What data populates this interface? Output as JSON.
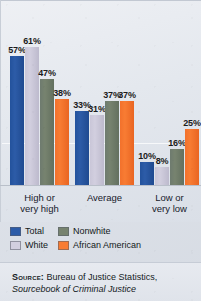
{
  "chart_data": {
    "type": "bar",
    "title": "",
    "subtitle": "",
    "xlabel": "",
    "ylabel": "",
    "ylim": [
      0,
      70
    ],
    "grid": true,
    "legend_position": "bottom-left",
    "categories": [
      "High or very high",
      "Average",
      "Low or very low"
    ],
    "category_lines": [
      [
        "High or",
        "very high"
      ],
      [
        "Average",
        ""
      ],
      [
        "Low or",
        "very low"
      ]
    ],
    "series": [
      {
        "name": "Total",
        "color": "#2d5ca8",
        "values": [
          57,
          33,
          10
        ],
        "labels": [
          "57%",
          "33%",
          "10%"
        ]
      },
      {
        "name": "White",
        "color": "#d2cfdf",
        "values": [
          61,
          31,
          8
        ],
        "labels": [
          "61%",
          "31%",
          "8%"
        ]
      },
      {
        "name": "Nonwhite",
        "color": "#77836f",
        "values": [
          47,
          37,
          16
        ],
        "labels": [
          "47%",
          "37%",
          "16%"
        ]
      },
      {
        "name": "African American",
        "color": "#f87c33",
        "values": [
          38,
          37,
          25
        ],
        "labels": [
          "38%",
          "37%",
          "25%"
        ]
      }
    ],
    "value_suffix": "%"
  },
  "legend": {
    "entries": [
      {
        "label": "Total",
        "color": "#2d5ca8"
      },
      {
        "label": "White",
        "color": "#d2cfdf"
      },
      {
        "label": "Nonwhite",
        "color": "#77836f"
      },
      {
        "label": "African American",
        "color": "#f87c33"
      }
    ]
  },
  "source": {
    "kicker": "Source:",
    "line1": " Bureau of Justice Statistics,",
    "line2": "Sourcebook of Criminal Justice"
  }
}
